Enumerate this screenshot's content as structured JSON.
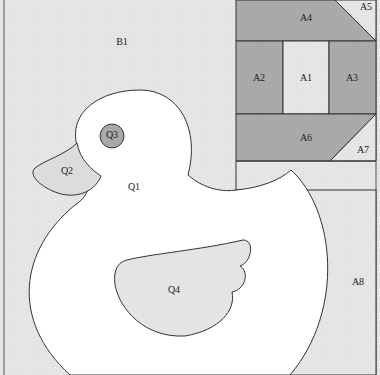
{
  "diagram": {
    "colors": {
      "background": "#e6e6e6",
      "dark_piece": "#a8a8a8",
      "light_piece": "#e8e8e8",
      "white_piece": "#ffffff",
      "stroke": "#333333"
    },
    "labels": {
      "B1": "B1",
      "A1": "A1",
      "A2": "A2",
      "A3": "A3",
      "A4": "A4",
      "A5": "A5",
      "A6": "A6",
      "A7": "A7",
      "A8": "A8",
      "Q1": "Q1",
      "Q2": "Q2",
      "Q3": "Q3",
      "Q4": "Q4"
    }
  }
}
